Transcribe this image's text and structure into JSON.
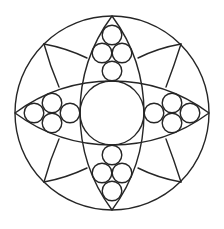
{
  "figure": {
    "title": "Geometric mandala line drawing",
    "stroke_color": "#262626",
    "background_color": "#ffffff"
  },
  "elements": {
    "outer_circle": "outer-circle",
    "lenses": [
      "vertical-lens",
      "horizontal-lens"
    ],
    "center_circle": "center-circle",
    "small_circle_clusters": [
      {
        "position": "top",
        "count": 4
      },
      {
        "position": "bottom",
        "count": 4
      },
      {
        "position": "left",
        "count": 4
      },
      {
        "position": "right",
        "count": 4
      }
    ],
    "diagonal_points": [
      "top-left",
      "top-right",
      "bottom-left",
      "bottom-right"
    ],
    "spokes_per_diagonal_point": 2
  }
}
